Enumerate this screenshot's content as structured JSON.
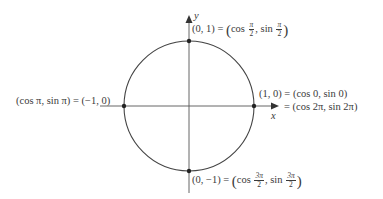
{
  "diagram": {
    "axes": {
      "x_label": "x",
      "y_label": "y"
    },
    "colors": {
      "stroke": "#3a3a3a",
      "text": "#3a3a3a"
    },
    "points": [
      {
        "id": "top",
        "coords": "(0, 1)",
        "eq": "=",
        "cos_arg_num": "π",
        "cos_arg_den": "2",
        "sin_arg_num": "π",
        "sin_arg_den": "2",
        "cos": "cos",
        "sin": "sin"
      },
      {
        "id": "right",
        "coords": "(1, 0)",
        "line1": "(1, 0) = (cos 0, sin 0)",
        "line2": "= (cos 2π, sin 2π)"
      },
      {
        "id": "left",
        "text": "(cos π, sin π) = (−1, 0)"
      },
      {
        "id": "bottom",
        "coords": "(0, −1)",
        "eq": "=",
        "cos_arg_num": "3π",
        "cos_arg_den": "2",
        "sin_arg_num": "3π",
        "sin_arg_den": "2",
        "cos": "cos",
        "sin": "sin"
      }
    ]
  }
}
